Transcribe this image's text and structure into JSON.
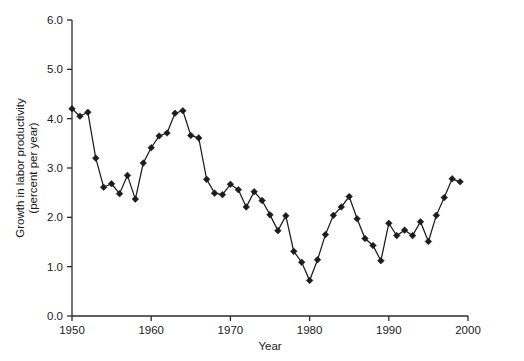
{
  "chart_data": {
    "type": "line",
    "title": "",
    "xlabel": "Year",
    "ylabel": "Growth in labor productivity (percent per year)",
    "ylabel_line1": "Growth in labor productivity",
    "ylabel_line2": "(percent per year)",
    "xlim": [
      1950,
      2000
    ],
    "ylim": [
      0.0,
      6.0
    ],
    "grid": false,
    "legend": false,
    "legend_position": "none",
    "marker": "diamond",
    "line_color": "#1c1c1c",
    "xticks": [
      1950,
      1960,
      1970,
      1980,
      1990,
      2000
    ],
    "xtick_labels": [
      "1950",
      "1960",
      "1970",
      "1980",
      "1990",
      "2000"
    ],
    "yticks": [
      0.0,
      1.0,
      2.0,
      3.0,
      4.0,
      5.0,
      6.0
    ],
    "ytick_labels": [
      "0.0",
      "1.0",
      "2.0",
      "3.0",
      "4.0",
      "5.0",
      "6.0"
    ],
    "x": [
      1950,
      1951,
      1952,
      1953,
      1954,
      1955,
      1956,
      1957,
      1958,
      1959,
      1960,
      1961,
      1962,
      1963,
      1964,
      1965,
      1966,
      1967,
      1968,
      1969,
      1970,
      1971,
      1972,
      1973,
      1974,
      1975,
      1976,
      1977,
      1978,
      1979,
      1980,
      1981,
      1982,
      1983,
      1984,
      1985,
      1986,
      1987,
      1988,
      1989,
      1990,
      1991,
      1992,
      1993,
      1994,
      1995,
      1996,
      1997,
      1998,
      1999
    ],
    "values": [
      4.2,
      4.05,
      4.13,
      3.2,
      2.61,
      2.68,
      2.48,
      2.85,
      2.37,
      3.1,
      3.41,
      3.65,
      3.71,
      4.11,
      4.16,
      3.66,
      3.61,
      2.77,
      2.49,
      2.46,
      2.67,
      2.56,
      2.21,
      2.52,
      2.34,
      2.05,
      1.73,
      2.03,
      1.31,
      1.09,
      0.72,
      1.14,
      1.65,
      2.04,
      2.21,
      2.42,
      1.97,
      1.57,
      1.43,
      1.12,
      1.88,
      1.63,
      1.74,
      1.63,
      1.91,
      1.51,
      2.04,
      2.4,
      2.78,
      2.72
    ],
    "series": [
      {
        "name": "Growth in labor productivity",
        "values": [
          4.2,
          4.05,
          4.13,
          3.2,
          2.61,
          2.68,
          2.48,
          2.85,
          2.37,
          3.1,
          3.41,
          3.65,
          3.71,
          4.11,
          4.16,
          3.66,
          3.61,
          2.77,
          2.49,
          2.46,
          2.67,
          2.56,
          2.21,
          2.52,
          2.34,
          2.05,
          1.73,
          2.03,
          1.31,
          1.09,
          0.72,
          1.14,
          1.65,
          2.04,
          2.21,
          2.42,
          1.97,
          1.57,
          1.43,
          1.12,
          1.88,
          1.63,
          1.74,
          1.63,
          1.91,
          1.51,
          2.04,
          2.4,
          2.78,
          2.72
        ]
      }
    ]
  }
}
